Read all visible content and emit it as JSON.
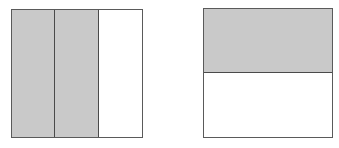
{
  "figures": [
    {
      "id": "left-square",
      "shape": "square",
      "division": "vertical",
      "parts": 3,
      "shaded_parts": 2,
      "fraction_shaded": "2/3",
      "shaded_indices": [
        0,
        1
      ]
    },
    {
      "id": "right-square",
      "shape": "square",
      "division": "horizontal",
      "parts": 2,
      "shaded_parts": 1,
      "fraction_shaded": "1/2",
      "shaded_indices": [
        0
      ]
    }
  ],
  "colors": {
    "shaded_fill": "#c9c9c9",
    "unshaded_fill": "#ffffff",
    "border": "#5a5a5a",
    "divider": "#4a4a4a"
  }
}
